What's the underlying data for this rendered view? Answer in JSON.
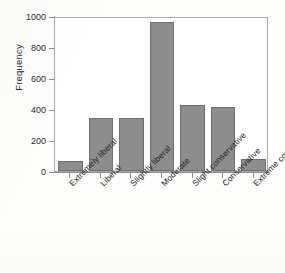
{
  "chart_data": {
    "type": "bar",
    "title": "",
    "xlabel": "",
    "ylabel": "Frequency",
    "categories": [
      "Extremely liberal",
      "Liberal",
      "Slightly liberal",
      "Moderate",
      "Slight conservative",
      "Conservative",
      "Extreme conservative"
    ],
    "values": [
      65,
      345,
      345,
      960,
      425,
      410,
      80
    ],
    "ylim": [
      0,
      1000
    ],
    "yticks": [
      0,
      200,
      400,
      600,
      800,
      1000
    ],
    "ytick_labels": [
      "0",
      "200",
      "400",
      "600",
      "800",
      "1000"
    ],
    "grid": false,
    "legend": false,
    "colors": {
      "bar_fill": "#8d8d8d",
      "bar_border": "#6e6e6e",
      "axis": "#8b8b8b",
      "frame": "#a9a9a9",
      "text": "#232323",
      "background": "#fdfdfc"
    }
  }
}
